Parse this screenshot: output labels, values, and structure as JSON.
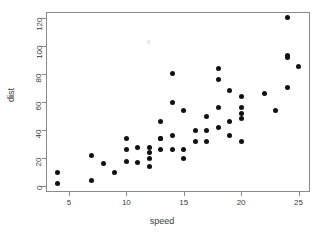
{
  "chart_data": {
    "type": "scatter",
    "title": "",
    "xlabel": "speed",
    "ylabel": "dist",
    "xlim": [
      3.0,
      26.0
    ],
    "ylim": [
      -4.0,
      124.0
    ],
    "xticks": [
      5,
      10,
      15,
      20,
      25
    ],
    "yticks": [
      0,
      20,
      40,
      60,
      80,
      100,
      120
    ],
    "xtick_labels": [
      "5",
      "10",
      "15",
      "20",
      "25"
    ],
    "ytick_labels": [
      "0",
      "20",
      "40",
      "60",
      "80",
      "100",
      "120"
    ],
    "grid": false,
    "legend": false,
    "point_color": "#111111",
    "frame_color": "#8a8a8a",
    "background": "#ffffff",
    "n_points": 50,
    "x": [
      4,
      4,
      7,
      7,
      8,
      9,
      10,
      10,
      10,
      11,
      11,
      12,
      12,
      12,
      12,
      13,
      13,
      13,
      13,
      14,
      14,
      14,
      14,
      15,
      15,
      15,
      16,
      16,
      17,
      17,
      17,
      18,
      18,
      18,
      18,
      19,
      19,
      19,
      20,
      20,
      20,
      20,
      20,
      22,
      23,
      24,
      24,
      24,
      24,
      25
    ],
    "y": [
      2,
      10,
      4,
      22,
      16,
      10,
      18,
      26,
      34,
      17,
      28,
      14,
      20,
      24,
      28,
      26,
      34,
      34,
      46,
      26,
      36,
      60,
      80,
      20,
      26,
      54,
      32,
      40,
      32,
      40,
      50,
      42,
      56,
      76,
      84,
      36,
      46,
      68,
      32,
      48,
      52,
      56,
      64,
      66,
      54,
      70,
      92,
      93,
      120,
      85
    ]
  }
}
